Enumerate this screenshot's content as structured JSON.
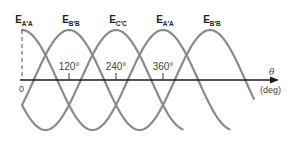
{
  "diagram": {
    "axis": {
      "origin_label": "0",
      "variable_label": "θ",
      "unit_label": "(deg)",
      "ticks": [
        {
          "value": 120,
          "label": "120°"
        },
        {
          "value": 240,
          "label": "240°"
        },
        {
          "value": 360,
          "label": "360°"
        }
      ]
    },
    "waves": [
      {
        "id": "EA1",
        "main": "E",
        "sub": "A′A",
        "peak_deg": 0,
        "start_deg": 0,
        "end_deg": 530
      },
      {
        "id": "EB",
        "main": "E",
        "sub": "B′B",
        "peak_deg": 120,
        "start_deg": 0,
        "end_deg": 592
      },
      {
        "id": "EC",
        "main": "E",
        "sub": "C′C",
        "peak_deg": 240,
        "start_deg": 0,
        "end_deg": 410
      }
    ],
    "peak_labels": [
      {
        "main": "E",
        "sub": "A′A",
        "deg": 0
      },
      {
        "main": "E",
        "sub": "B′B",
        "deg": 120
      },
      {
        "main": "E",
        "sub": "C′C",
        "deg": 240
      },
      {
        "main": "E",
        "sub": "A′A",
        "deg": 360
      },
      {
        "main": "E",
        "sub": "B′B",
        "deg": 480
      }
    ],
    "colors": {
      "wave": "#8a8a8a",
      "axis": "#1a1a1a",
      "text": "#222222"
    }
  }
}
